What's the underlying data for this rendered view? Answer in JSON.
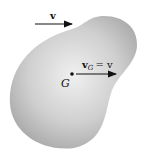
{
  "diagram": {
    "body": {
      "fill_center": "#f2f2f2",
      "fill_edge": "#a8a8a8"
    },
    "velocity_arrow_top": {
      "label": "v"
    },
    "center_of_mass": {
      "label": "G"
    },
    "velocity_arrow_G": {
      "label_main": "v",
      "label_sub": "G",
      "label_rest": "= v"
    }
  }
}
